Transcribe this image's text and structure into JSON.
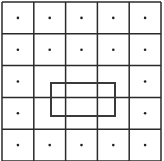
{
  "diagram": {
    "type": "dot-grid-with-rectangle",
    "grid": {
      "rows": 5,
      "cols": 5,
      "origin_x": 2,
      "origin_y": 2,
      "cell_size": 31.8,
      "line_color": "#2a2a2a",
      "line_width": 1.5
    },
    "dots": {
      "color": "#222222",
      "radius": 1.3,
      "present": [
        [
          1,
          1,
          1,
          1,
          1
        ],
        [
          1,
          1,
          1,
          1,
          1
        ],
        [
          1,
          0,
          0,
          0,
          1
        ],
        [
          1,
          0,
          0,
          0,
          1
        ],
        [
          1,
          1,
          1,
          1,
          1
        ]
      ]
    },
    "rectangle": {
      "x": 51,
      "y": 83,
      "width": 64,
      "height": 33,
      "stroke_color": "#3a3a3a",
      "stroke_width": 2
    }
  }
}
